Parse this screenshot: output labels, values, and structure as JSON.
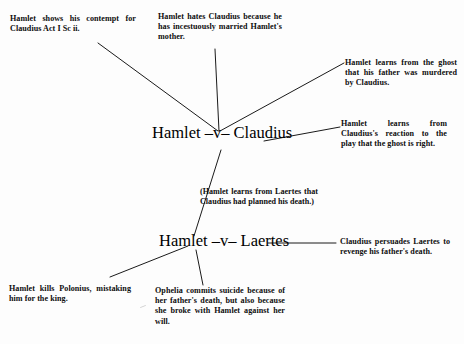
{
  "diagram": {
    "type": "conflict-map",
    "nodes": [
      {
        "id": "hamlet-v-claudius",
        "label": "Hamlet –v– Claudius"
      },
      {
        "id": "hamlet-v-laertes",
        "label": "Hamlet –v– Laertes"
      }
    ],
    "notes": {
      "contempt": "Hamlet shows his contempt for Claudius Act I Sc ii.",
      "hates": "Hamlet hates Claudius because he has incestuously married Hamlet's mother.",
      "ghost": "Hamlet learns from the ghost that his father was murdered by Claudius.",
      "play": "Hamlet learns from Claudius's reaction to the play that the ghost is right.",
      "laertes_plot": "(Hamlet learns from Laertes that Claudius had planned his death.)",
      "revenge": "Claudius persuades Laertes to revenge his father's death.",
      "polonius": "Hamlet kills Polonius, mistaking him for the king.",
      "ophelia": "Ophelia commits suicide because of her father's death, but also because she broke with Hamlet against her will."
    },
    "colors": {
      "ink": "#0d0d0d",
      "line": "#1a1a1a",
      "background": "#fdfdfd"
    }
  }
}
